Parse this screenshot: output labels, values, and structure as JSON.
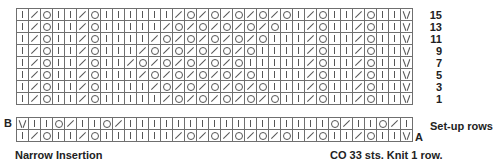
{
  "chart_data": {
    "type": "table",
    "title": "Narrow Insertion",
    "legend": {
      "K": "knit (|)",
      "D": "decrease (/)",
      "O": "yarn over (o)",
      "V": "slip (v)"
    },
    "main_rows": [
      {
        "label": "15",
        "cells": "K D O K K D O K K K K K K D O D O D O D O D O K D O K K D O K K V"
      },
      {
        "label": "13",
        "cells": "K D O K K D O K K K K K D O D O D O D O D O K K D O K K D O K K V"
      },
      {
        "label": "11",
        "cells": "K D O K K D O K K K K D O D O D O D O D O K K K D O K K D O K K V"
      },
      {
        "label": "9",
        "cells": "K D O K K D O K K K D O D O D O D O D O K K K K D O K K D O K K V"
      },
      {
        "label": "7",
        "cells": "K D O K K D O K K D O D O D O D O D O K K K K K D O K K D O K K V"
      },
      {
        "label": "5",
        "cells": "K D O K K D O K K K D O D O D O D O D O K K K K D O K K D O K K V"
      },
      {
        "label": "3",
        "cells": "K D O K K D O K K K K D O D O D O D O D O K K K D O K K D O K K V"
      },
      {
        "label": "1",
        "cells": "K D O K K D O K K K K K D O D O D O D O D O K K D O K K D O K K V"
      }
    ],
    "setup_rows": [
      {
        "label": "B",
        "cells": "V K K O D K K O D K K K K K K K K K K K K K K K K K O D K K O D K"
      },
      {
        "label": "A",
        "cells": "K D O K K D O K K K K K K D O D O D O D O D O K D O K K D O K K V"
      }
    ],
    "columns": 33
  },
  "labels": {
    "b_marker": "B",
    "a_marker": "A",
    "setup_rows": "Set-up rows",
    "title": "Narrow Insertion",
    "cast_on_note": "CO 33 sts. Knit 1 row."
  }
}
